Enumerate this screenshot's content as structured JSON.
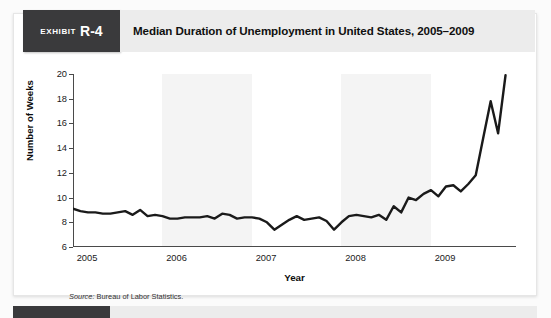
{
  "exhibit": {
    "tag_word": "Exhibit",
    "tag_number": "R-4",
    "title": "Median Duration of Unemployment in United States, 2005–2009",
    "source_prefix": "Source:",
    "source_text": " Bureau of Labor Statistics."
  },
  "colors": {
    "tag_bg": "#3a3a3c",
    "title_bg": "#ececec",
    "line": "#1a1a1a",
    "band": "#f4f4f4",
    "axis": "#4a4a4a"
  },
  "chart_data": {
    "type": "line",
    "title": "Median Duration of Unemployment in United States, 2005–2009",
    "xlabel": "Year",
    "ylabel": "Number of Weeks",
    "ylim": [
      6,
      20
    ],
    "yticks": [
      6,
      8,
      10,
      12,
      14,
      16,
      18,
      20
    ],
    "xlim": [
      2005.0,
      2009.95
    ],
    "xticks": [
      2005,
      2006,
      2007,
      2008,
      2009
    ],
    "xticklabels": [
      "2005",
      "2006",
      "2007",
      "2008",
      "2009"
    ],
    "grid": false,
    "legend": false,
    "shaded_bands": [
      [
        2006.0,
        2007.0
      ],
      [
        2008.0,
        2009.0
      ]
    ],
    "series": [
      {
        "name": "Median duration of unemployment (weeks)",
        "x": [
          2005.0,
          2005.083,
          2005.167,
          2005.25,
          2005.333,
          2005.417,
          2005.5,
          2005.583,
          2005.667,
          2005.75,
          2005.833,
          2005.917,
          2006.0,
          2006.083,
          2006.167,
          2006.25,
          2006.333,
          2006.417,
          2006.5,
          2006.583,
          2006.667,
          2006.75,
          2006.833,
          2006.917,
          2007.0,
          2007.083,
          2007.167,
          2007.25,
          2007.333,
          2007.417,
          2007.5,
          2007.583,
          2007.667,
          2007.75,
          2007.833,
          2007.917,
          2008.0,
          2008.083,
          2008.167,
          2008.25,
          2008.333,
          2008.417,
          2008.5,
          2008.583,
          2008.667,
          2008.75,
          2008.833,
          2008.917,
          2009.0,
          2009.083,
          2009.167,
          2009.25,
          2009.333,
          2009.417,
          2009.5,
          2009.583,
          2009.667,
          2009.75,
          2009.833
        ],
        "values": [
          9.1,
          8.9,
          8.8,
          8.8,
          8.7,
          8.7,
          8.8,
          8.9,
          8.6,
          9.0,
          8.5,
          8.6,
          8.5,
          8.3,
          8.3,
          8.4,
          8.4,
          8.4,
          8.5,
          8.3,
          8.7,
          8.6,
          8.3,
          8.4,
          8.4,
          8.3,
          8.0,
          7.4,
          7.8,
          8.2,
          8.5,
          8.2,
          8.3,
          8.4,
          8.1,
          7.4,
          8.0,
          8.5,
          8.6,
          8.5,
          8.4,
          8.6,
          8.2,
          9.3,
          8.8,
          10.0,
          9.8,
          10.3,
          10.6,
          10.1,
          10.9,
          11.0,
          10.5,
          11.1,
          11.8,
          14.8,
          17.8,
          15.2,
          19.9
        ]
      }
    ]
  }
}
